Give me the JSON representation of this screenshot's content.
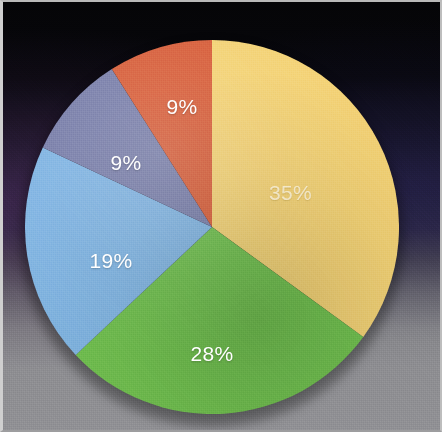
{
  "chart_data": {
    "type": "pie",
    "title": "",
    "subtitle": "",
    "xlabel": "",
    "ylabel": "",
    "legend": "none",
    "grid": false,
    "units": "percent",
    "total": 100,
    "start_angle_deg": 0,
    "direction": "clockwise",
    "categories": [
      "Slice 1",
      "Slice 2",
      "Slice 3",
      "Slice 4",
      "Slice 5"
    ],
    "values": [
      35,
      28,
      19,
      9,
      9
    ],
    "labels": [
      "35%",
      "28%",
      "19%",
      "9%",
      "9%"
    ],
    "colors": [
      "#F4D478",
      "#73C252",
      "#83B6E3",
      "#7B80AB",
      "#D8603C"
    ],
    "slices": [
      {
        "label": "35%",
        "value": 35,
        "color": "#F4D478",
        "color_name": "yellow",
        "start_deg": 0,
        "end_deg": 126,
        "label_color": "#FFFFFF",
        "label_x_pct": 71,
        "label_y_pct": 41
      },
      {
        "label": "28%",
        "value": 28,
        "color": "#73C252",
        "color_name": "green",
        "start_deg": 126,
        "end_deg": 226.8,
        "label_color": "#FFFFFF",
        "label_x_pct": 50,
        "label_y_pct": 84
      },
      {
        "label": "19%",
        "value": 19,
        "color": "#83B6E3",
        "color_name": "light-blue",
        "start_deg": 226.8,
        "end_deg": 295.2,
        "label_color": "#FFFFFF",
        "label_x_pct": 23,
        "label_y_pct": 59
      },
      {
        "label": "9%",
        "value": 9,
        "color": "#7B80AB",
        "color_name": "slate-purple",
        "start_deg": 295.2,
        "end_deg": 327.6,
        "label_color": "#FFFFFF",
        "label_x_pct": 27,
        "label_y_pct": 33
      },
      {
        "label": "9%",
        "value": 9,
        "color": "#D8603C",
        "color_name": "red-orange",
        "start_deg": 327.6,
        "end_deg": 360,
        "label_color": "#FFFFFF",
        "label_x_pct": 42,
        "label_y_pct": 18
      }
    ]
  },
  "scene": {
    "background_top_color": "#050507",
    "background_mid_color": "#2E2A45",
    "background_bottom_color": "#919195",
    "border_color": "#CFCFCF",
    "texture": "canvas-weave"
  }
}
